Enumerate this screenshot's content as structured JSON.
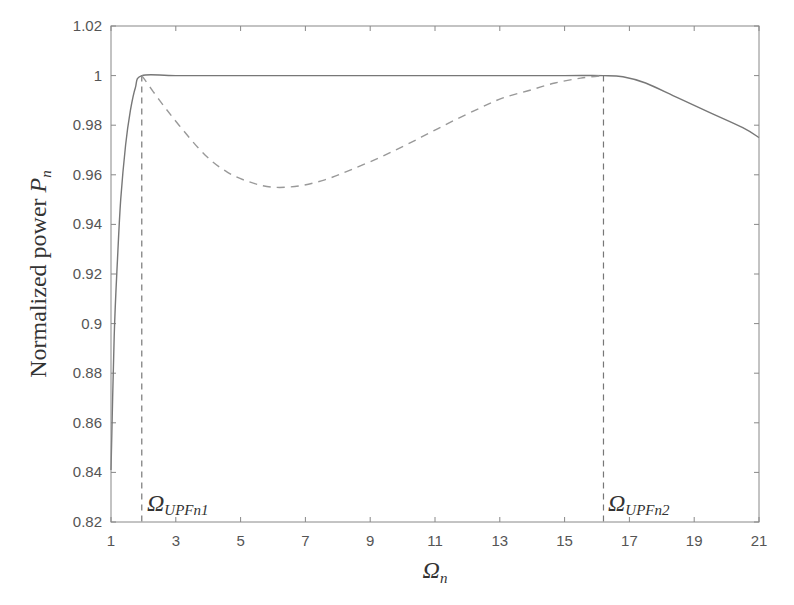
{
  "chart_data": {
    "type": "line",
    "title": "",
    "xlabel": "Ω_n",
    "ylabel": "Normalized power P_n",
    "xlim": [
      1,
      21
    ],
    "ylim": [
      0.82,
      1.02
    ],
    "xticks": [
      1,
      3,
      5,
      7,
      9,
      11,
      13,
      15,
      17,
      19,
      21
    ],
    "yticks": [
      0.82,
      0.84,
      0.86,
      0.88,
      0.9,
      0.92,
      0.94,
      0.96,
      0.98,
      1,
      1.02
    ],
    "ytick_labels": [
      "0.82",
      "0.84",
      "0.86",
      "0.88",
      "0.9",
      "0.92",
      "0.94",
      "0.96",
      "0.98",
      "1",
      "1.02"
    ],
    "grid": false,
    "legend": null,
    "series": [
      {
        "name": "solid",
        "style": "solid",
        "x": [
          1.0,
          1.1,
          1.2,
          1.3,
          1.45,
          1.6,
          1.75,
          1.95,
          3,
          5,
          7,
          9,
          11,
          13,
          15,
          16.2,
          16.8,
          17.5,
          18.5,
          19.5,
          20.5,
          21
        ],
        "y": [
          0.841,
          0.895,
          0.926,
          0.95,
          0.972,
          0.986,
          0.995,
          1.0,
          1.0,
          1.0,
          1.0,
          1.0,
          1.0,
          1.0,
          1.0,
          1.0,
          0.9995,
          0.997,
          0.991,
          0.985,
          0.979,
          0.975
        ]
      },
      {
        "name": "dashed",
        "style": "dashed",
        "x": [
          1.95,
          2.5,
          3.1,
          3.9,
          4.6,
          5.3,
          6.0,
          6.8,
          7.6,
          8.4,
          9.3,
          10.1,
          10.85,
          11.6,
          12.4,
          13.1,
          13.9,
          14.7,
          15.5,
          16.2
        ],
        "y": [
          1.0,
          0.99,
          0.98,
          0.968,
          0.961,
          0.957,
          0.955,
          0.9555,
          0.958,
          0.962,
          0.967,
          0.972,
          0.977,
          0.982,
          0.987,
          0.991,
          0.994,
          0.997,
          0.999,
          1.0
        ]
      }
    ],
    "annotations": [
      {
        "text": "Ω",
        "subscript": "UPFn1",
        "x": 1.95,
        "type": "vertical-dashed-line"
      },
      {
        "text": "Ω",
        "subscript": "UPFn2",
        "x": 16.2,
        "type": "vertical-dashed-line"
      }
    ]
  },
  "labels": {
    "ylabel_main": "Normalized power ",
    "ylabel_var": "P",
    "ylabel_sub": "n",
    "xlabel_var": "Ω",
    "xlabel_sub": "n",
    "annot1_var": "Ω",
    "annot1_sub": "UPFn1",
    "annot2_var": "Ω",
    "annot2_sub": "UPFn2"
  }
}
